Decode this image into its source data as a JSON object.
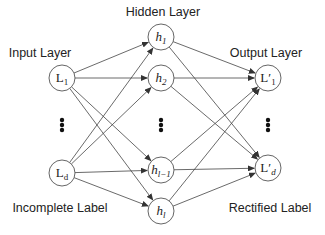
{
  "diagram": {
    "layers": {
      "input": {
        "label": "Input Layer",
        "caption": "Incomplete Label"
      },
      "hidden": {
        "label": "Hidden Layer"
      },
      "output": {
        "label": "Output Layer",
        "caption": "Rectified Label"
      }
    },
    "nodes": {
      "input": [
        {
          "id": "L1",
          "base": "L",
          "sub": "1",
          "italic": false
        },
        {
          "id": "Ld",
          "base": "L",
          "sub": "d",
          "italic": false
        }
      ],
      "hidden": [
        {
          "id": "h1",
          "base": "h",
          "sub": "1",
          "italic": true
        },
        {
          "id": "h2",
          "base": "h",
          "sub": "2",
          "italic": true
        },
        {
          "id": "hl-1",
          "base": "h",
          "sub": "l−1",
          "italic": true
        },
        {
          "id": "hl",
          "base": "h",
          "sub": "l",
          "italic": true
        }
      ],
      "output": [
        {
          "id": "L'1",
          "base": "L′",
          "sub": "1",
          "italic": false
        },
        {
          "id": "L'd",
          "base": "L′",
          "sub": "d",
          "italic": false,
          "sub_italic": true
        }
      ]
    },
    "ellipsis": "vertical dots",
    "connections": "fully connected input→hidden→output"
  }
}
